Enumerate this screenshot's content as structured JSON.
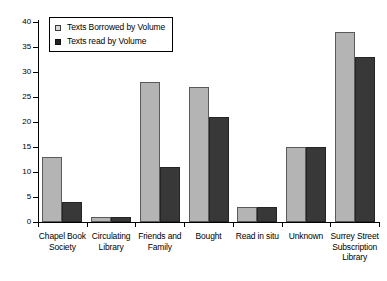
{
  "chart_data": {
    "type": "bar",
    "title": "",
    "subtitle": "",
    "xlabel": "",
    "ylabel": "",
    "ylim": [
      0,
      40
    ],
    "yticks": [
      0,
      5,
      10,
      15,
      20,
      25,
      30,
      35,
      40
    ],
    "grid": false,
    "legend_position": "top-left",
    "categories": [
      "Chapel Book\nSociety",
      "Circulating\nLibrary",
      "Friends and\nFamily",
      "Bought",
      "Read in situ",
      "Unknown",
      "Surrey Street\nSubscription\nLibrary"
    ],
    "series": [
      {
        "name": "Texts Borrowed by Volume",
        "color": "#b4b4b4",
        "values": [
          13,
          1,
          28,
          27,
          3,
          15,
          38
        ]
      },
      {
        "name": "Texts read by Volume",
        "color": "#383838",
        "values": [
          4,
          1,
          11,
          21,
          3,
          15,
          33
        ]
      }
    ]
  }
}
